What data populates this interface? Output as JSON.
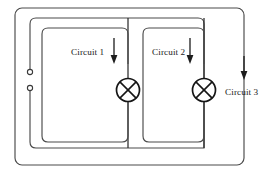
{
  "diagram": {
    "background_color": "#ffffff",
    "wire_color": "#4a4a4a",
    "symbol_color": "#151515",
    "labels": {
      "circuit_1": "Circuit 1",
      "circuit_2": "Circuit 2",
      "circuit_3": "Circuit 3"
    },
    "components": {
      "lamp_1_name": "lamp-symbol",
      "lamp_2_name": "lamp-symbol",
      "terminal_top_name": "terminal-node",
      "terminal_bottom_name": "terminal-node"
    },
    "flow_arrows": {
      "circuit_1_direction": "down",
      "circuit_2_direction": "down",
      "circuit_3_direction": "down"
    }
  }
}
